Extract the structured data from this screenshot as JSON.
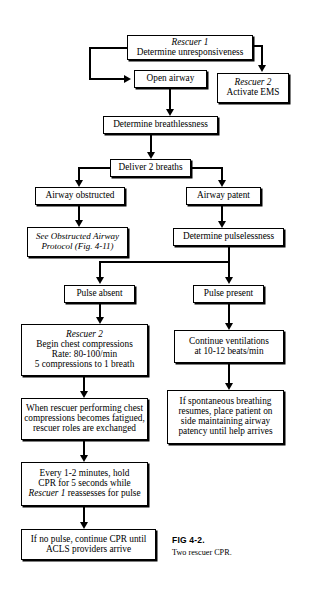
{
  "figure": {
    "number": "FIG 4-2.",
    "caption": "Two rescuer CPR."
  },
  "nodes": {
    "rescuer1": {
      "line1": "Rescuer 1",
      "line2": "Determine unresponsiveness"
    },
    "open_airway": {
      "line1": "Open airway"
    },
    "rescuer2_ems": {
      "line1": "Rescuer 2",
      "line2": "Activate EMS"
    },
    "determine_breathlessness": {
      "line1": "Determine breathlessness"
    },
    "deliver_2_breaths": {
      "line1": "Deliver 2 breaths"
    },
    "airway_obstructed": {
      "line1": "Airway obstructed"
    },
    "airway_patent": {
      "line1": "Airway patent"
    },
    "see_obstructed_protocol": {
      "line1": "See Obstructed Airway",
      "line2": "Protocol (Fig. 4-11)"
    },
    "determine_pulselessness": {
      "line1": "Determine pulselessness"
    },
    "pulse_absent": {
      "line1": "Pulse absent"
    },
    "pulse_present": {
      "line1": "Pulse present"
    },
    "begin_compressions": {
      "line1": "Rescuer 2",
      "line2": "Begin chest compressions",
      "line3": "Rate: 80-100/min",
      "line4": "5 compressions to 1 breath"
    },
    "continue_ventilations": {
      "line1": "Continue ventilations",
      "line2": "at 10-12 beats/min"
    },
    "rescuer_roles_exchanged": {
      "line1": "When rescuer performing chest",
      "line2": "compressions becomes fatigued,",
      "line3": "rescuer roles are exchanged"
    },
    "spontaneous_breathing": {
      "line1": "If spontaneous breathing",
      "line2": "resumes, place patient on",
      "line3": "side maintaining airway",
      "line4": "patency until help arrives"
    },
    "hold_cpr_reassess": {
      "line1": "Every 1-2 minutes, hold",
      "line2": "CPR for 5 seconds while",
      "line3": "Rescuer 1",
      "line3_rest": " reassesses for pulse"
    },
    "continue_until_acls": {
      "line1": "If no pulse, continue CPR until",
      "line2": "ACLS providers arrive"
    }
  },
  "colors": {
    "line": "#000000",
    "background": "#ffffff"
  }
}
